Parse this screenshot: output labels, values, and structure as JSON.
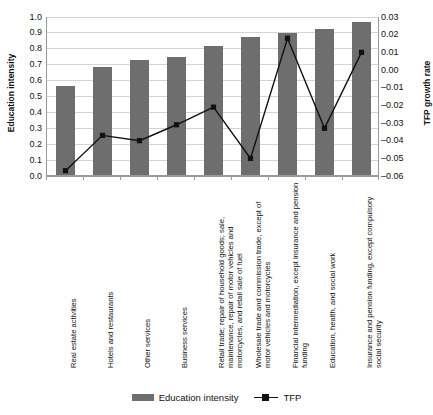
{
  "chart_data": {
    "type": "bar",
    "title": "",
    "xlabel": "",
    "ylabel": "Education intensity",
    "y2label": "TFP growth rate",
    "grid": true,
    "legend_position": "bottom",
    "ylim": [
      0.0,
      1.0
    ],
    "y2lim": [
      -0.06,
      0.03
    ],
    "yticks": [
      "0.0",
      "0.1",
      "0.2",
      "0.3",
      "0.4",
      "0.5",
      "0.6",
      "0.7",
      "0.8",
      "0.9",
      "1.0"
    ],
    "y2ticks": [
      "-0.06",
      "-0.05",
      "-0.04",
      "-0.03",
      "-0.02",
      "-0.01",
      "0.00",
      "0.01",
      "0.02",
      "0.03"
    ],
    "categories": [
      "Real estate activities",
      "Hotels and restaurants",
      "Other services",
      "Business services",
      "Retail trade; repair of household goods; sale, maintenance, repair of motor vehicles and motorcycles, and retail sale of fuel",
      "Wholesale trade and commission trade, except of motor vehicles and motorcycles",
      "Financial intermediation, except insurance and pension funding",
      "Education, health, and social work",
      "Insurance and pension funding, except compulsory social security"
    ],
    "series": [
      {
        "name": "Education intensity",
        "axis": "left",
        "type": "bar",
        "color": "#6e6e6e",
        "values": [
          0.56,
          0.68,
          0.725,
          0.74,
          0.81,
          0.87,
          0.895,
          0.92,
          0.965
        ]
      },
      {
        "name": "TFP",
        "axis": "right",
        "type": "line",
        "color": "#111111",
        "marker": "square",
        "values": [
          -0.057,
          -0.037,
          -0.04,
          -0.031,
          -0.021,
          -0.05,
          0.018,
          -0.033,
          0.01
        ]
      }
    ]
  },
  "legend": {
    "items": [
      {
        "label": "Education intensity",
        "marker": "bar-swatch"
      },
      {
        "label": "TFP",
        "marker": "line-square-marker"
      }
    ]
  }
}
